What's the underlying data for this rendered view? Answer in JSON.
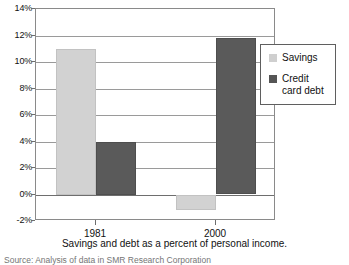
{
  "chart_data": {
    "type": "bar",
    "title": "",
    "caption": "Savings and debt as a percent of personal income.",
    "source": "Source: Analysis of data in SMR Research Corporation",
    "categories": [
      "1981",
      "2000"
    ],
    "series": [
      {
        "name": "Savings",
        "color": "#d2d2d2",
        "values": [
          11.0,
          -1.2
        ]
      },
      {
        "name": "Credit card debt",
        "color": "#5a5a5a",
        "values": [
          4.0,
          11.8
        ]
      }
    ],
    "xlabel": "",
    "ylabel": "",
    "ylim": [
      -2,
      14
    ],
    "ytick_step": 2,
    "yticks": [
      "14%",
      "12%",
      "10%",
      "8%",
      "6%",
      "4%",
      "2%",
      "0%",
      "-2%"
    ],
    "ytick_values": [
      14,
      12,
      10,
      8,
      6,
      4,
      2,
      0,
      -2
    ],
    "grid": true,
    "legend_position": "right-inside",
    "value_suffix": "%"
  },
  "legend": {
    "entries": [
      {
        "label": "Savings",
        "swatch": "savings-swatch"
      },
      {
        "label": "Credit card debt",
        "swatch": "debt-swatch"
      }
    ]
  },
  "axis": {
    "y_labels": [
      "14%",
      "12%",
      "10%",
      "8%",
      "6%",
      "4%",
      "2%",
      "0%",
      "-2%"
    ],
    "x_labels": [
      "1981",
      "2000"
    ]
  },
  "caption": {
    "text": "Savings and debt as a percent of personal income."
  },
  "source": {
    "text": "Source: Analysis of data in SMR Research Corporation"
  }
}
